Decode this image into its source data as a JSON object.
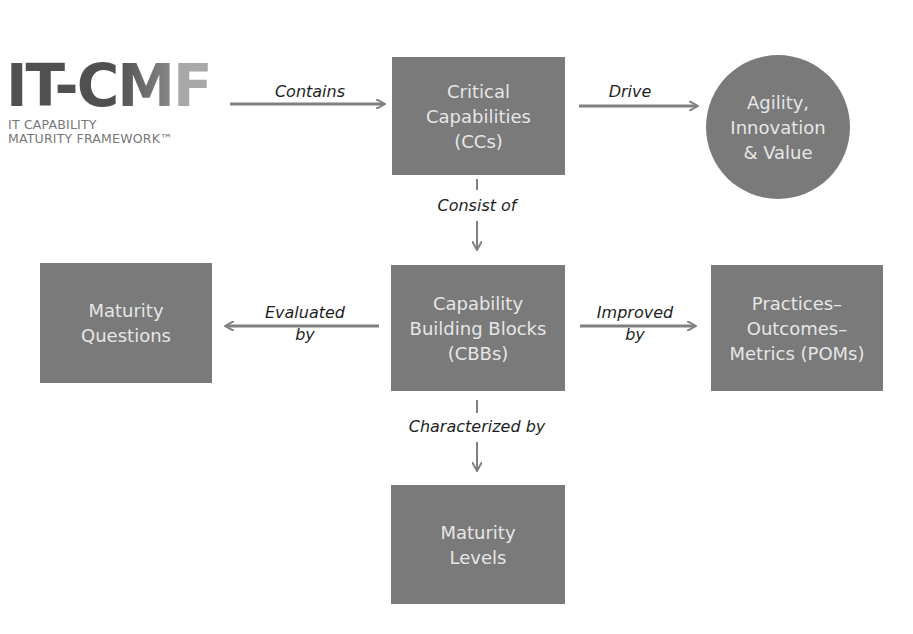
{
  "logo": {
    "part1": "IT-C",
    "part2": "M",
    "part3": "F",
    "subtitle": "IT CAPABILITY\nMATURITY FRAMEWORK™"
  },
  "nodes": {
    "critical_capabilities": "Critical\nCapabilities\n(CCs)",
    "outcome": "Agility,\nInnovation\n& Value",
    "maturity_questions": "Maturity\nQuestions",
    "cbbs": "Capability\nBuilding Blocks\n(CBBs)",
    "poms": "Practices–\nOutcomes–\nMetrics (POMs)",
    "maturity_levels": "Maturity\nLevels"
  },
  "edges": {
    "contains": "Contains",
    "drive": "Drive",
    "consist_of": "Consist of",
    "evaluated_by": "Evaluated\nby",
    "improved_by": "Improved\nby",
    "characterized_by": "Characterized by"
  },
  "colors": {
    "node_fill": "#7a7a7a",
    "node_text": "#e6e6e6",
    "arrow": "#808080",
    "label_text": "#1e1e1e"
  }
}
